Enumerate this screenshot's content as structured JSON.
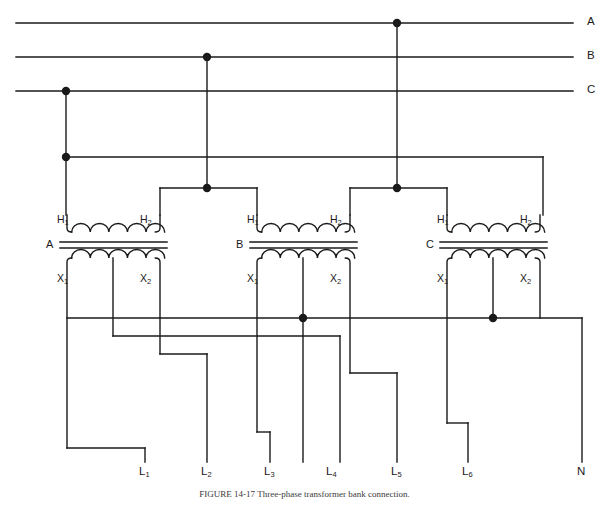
{
  "figure": {
    "caption": "FIGURE 14-17   Three-phase transformer bank connection.",
    "stroke_color": "#1a1a1a",
    "background_color": "#ffffff",
    "line_width": 1.4,
    "dot_radius": 4.2
  },
  "supply": {
    "label": "Three-phase supply lines",
    "lines": [
      {
        "name": "A",
        "label": "A",
        "y": 23,
        "tap_x": 397
      },
      {
        "name": "B",
        "label": "B",
        "y": 57,
        "tap_x": 207
      },
      {
        "name": "C",
        "label": "C",
        "y": 91,
        "tap_x": 66
      }
    ],
    "label_x": 589,
    "line_x_start": 16,
    "line_x_end": 573
  },
  "bus": {
    "label": "Phase C feeder bus",
    "y": 157,
    "x_start": 66,
    "x_end": 543
  },
  "transformers": [
    {
      "id": "A",
      "core_label": "A",
      "primary": {
        "h1_label": "H",
        "h1_sub": "1",
        "h2_label": "H",
        "h2_sub": "2"
      },
      "secondary": {
        "x1_label": "X",
        "x1_sub": "1",
        "x2_label": "X",
        "x2_sub": "2"
      },
      "left_x": 67,
      "right_x": 160,
      "center_x": 113,
      "core_y": 245,
      "h1_riser_to": 157,
      "h2_riser_to": 188,
      "center_tap": {
        "present": true,
        "dot": false,
        "drop_to": 336,
        "route_to_x": 340
      }
    },
    {
      "id": "B",
      "core_label": "B",
      "primary": {
        "h1_label": "H",
        "h1_sub": "1",
        "h2_label": "H",
        "h2_sub": "2"
      },
      "secondary": {
        "x1_label": "X",
        "x1_sub": "1",
        "x2_label": "X",
        "x2_sub": "2"
      },
      "left_x": 257,
      "right_x": 350,
      "center_x": 303,
      "core_y": 245,
      "h1_riser_to": 188,
      "h2_riser_to": 188,
      "center_tap": {
        "present": true,
        "dot": true,
        "drop_to": 318,
        "route_to_x": 303
      }
    },
    {
      "id": "C",
      "core_label": "C",
      "primary": {
        "h1_label": "H",
        "h1_sub": "1",
        "h2_label": "H",
        "h2_sub": "2"
      },
      "secondary": {
        "x1_label": "X",
        "x1_sub": "1",
        "x2_label": "X",
        "x2_sub": "2"
      },
      "left_x": 447,
      "right_x": 540,
      "center_x": 493,
      "core_y": 245,
      "h1_riser_to": 188,
      "h2_riser_to": 157,
      "center_tap": {
        "present": true,
        "dot": true,
        "drop_to": 318,
        "route_to_x": 493
      }
    }
  ],
  "neutral_bus": {
    "label": "Neutral bus",
    "y": 318,
    "x_start": 67,
    "x_end": 582,
    "drop_x": 582,
    "drop_to": 462
  },
  "junction_dots": [
    {
      "name": "phase-a-tap",
      "x": 397,
      "y": 23
    },
    {
      "name": "phase-b-tap",
      "x": 207,
      "y": 57
    },
    {
      "name": "phase-c-tap",
      "x": 66,
      "y": 91
    },
    {
      "name": "bus-c-junction",
      "x": 66,
      "y": 157
    },
    {
      "name": "delta-node-b",
      "x": 207,
      "y": 188
    },
    {
      "name": "delta-node-a",
      "x": 397,
      "y": 188
    },
    {
      "name": "center-tap-b",
      "x": 303,
      "y": 318
    },
    {
      "name": "center-tap-c",
      "x": 493,
      "y": 318
    }
  ],
  "outputs": {
    "label": "Secondary output terminals",
    "label_y": 466,
    "terminals": [
      {
        "name": "L1",
        "label": "L",
        "sub": "1",
        "x": 145,
        "source": "A-X1",
        "route": {
          "from_x": 67,
          "drop_y": 448
        }
      },
      {
        "name": "L2",
        "label": "L",
        "sub": "2",
        "x": 207,
        "source": "A-X2",
        "route": {
          "from_x": 160,
          "drop_y": 354
        }
      },
      {
        "name": "L3",
        "label": "L",
        "sub": "3",
        "x": 270,
        "source": "B-X1",
        "route": {
          "from_x": 257,
          "drop_y": 432
        }
      },
      {
        "name": "L4",
        "label": "L",
        "sub": "4",
        "x": 332,
        "source": "A-center",
        "route": {
          "from_x": 340,
          "drop_y": 336
        }
      },
      {
        "name": "L5",
        "label": "L",
        "sub": "5",
        "x": 397,
        "source": "B-X2",
        "route": {
          "from_x": 350,
          "drop_y": 373
        }
      },
      {
        "name": "L6",
        "label": "L",
        "sub": "6",
        "x": 468,
        "source": "C-X1",
        "route": {
          "from_x": 447,
          "drop_y": 423
        }
      },
      {
        "name": "N",
        "label": "N",
        "sub": "",
        "x": 582,
        "source": "neutral",
        "route": {
          "from_x": 582,
          "drop_y": 318
        }
      }
    ]
  }
}
